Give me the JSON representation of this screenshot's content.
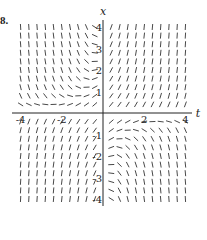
{
  "problem_label": "8.",
  "chart_data": {
    "type": "slope_field",
    "title": "",
    "xlabel": "t",
    "ylabel": "x",
    "xlim": [
      -4,
      4
    ],
    "ylim": [
      -4,
      4
    ],
    "x_ticks": [
      -4,
      -2,
      2,
      4
    ],
    "y_ticks": [
      -4,
      -3,
      -2,
      -1,
      1,
      2,
      3,
      4
    ],
    "x_tick_labels": [
      "-4",
      "-2",
      "2",
      "4"
    ],
    "y_tick_labels": [
      "-4",
      "-3",
      "-2",
      "-1",
      "1",
      "2",
      "3",
      "4"
    ],
    "grid": false,
    "approx_equation": "dx/dt = 1 + t*x",
    "sample_spacing": 0.4,
    "color": "#333333"
  }
}
